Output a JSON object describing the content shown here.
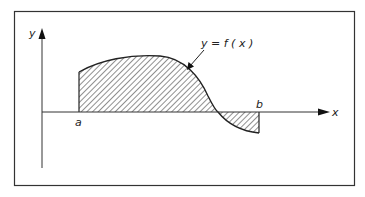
{
  "figure": {
    "type": "definite-integral-area",
    "axes": {
      "x_label": "x",
      "y_label": "y"
    },
    "curve_label": "y = f ( x )",
    "bounds": {
      "lower": "a",
      "upper": "b"
    },
    "regions": [
      {
        "name": "positive-area",
        "position": "above x-axis, from a to crossing"
      },
      {
        "name": "negative-area",
        "position": "below x-axis, from crossing to b"
      }
    ],
    "colors": {
      "stroke": "#222222",
      "hatch": "#333333",
      "background": "#ffffff"
    }
  }
}
